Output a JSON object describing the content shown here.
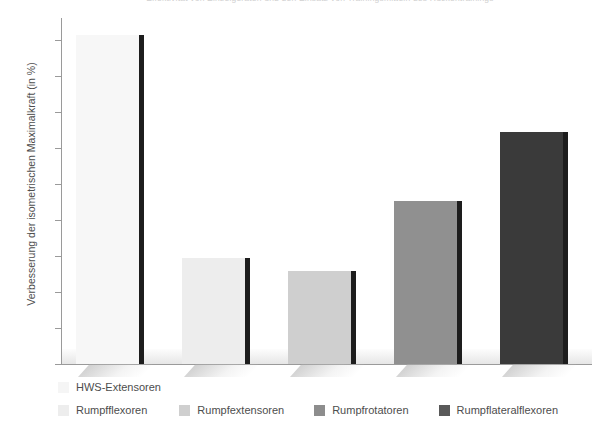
{
  "header": {
    "clipped_text": "Effektivität von Einzelgeräten und den Einsatz von Trainingsmitteln des Rückentrainings"
  },
  "chart_data": {
    "type": "bar",
    "title": "",
    "xlabel": "",
    "ylabel": "Verbesserung der isometrischen Maximalkraft (in %)",
    "ylim": [
      0,
      95
    ],
    "yticks": [
      0,
      10,
      20,
      30,
      40,
      50,
      60,
      70,
      80,
      90
    ],
    "ytick_labels": [
      "0",
      "10",
      "20",
      "30",
      "40",
      "50",
      "60",
      "70",
      "80",
      "90"
    ],
    "grid": false,
    "legend_position": "bottom",
    "categories": [
      "HWS-Extensoren",
      "Rumpfflexoren",
      "Rumpfextensoren",
      "Rumpfrotatoren",
      "Rumpflateralflexoren"
    ],
    "values": [
      91.5,
      29.5,
      25.8,
      45.3,
      64.5
    ],
    "colors": [
      "#f7f7f7",
      "#ededed",
      "#cfcfcf",
      "#909090",
      "#3a3a3a"
    ]
  },
  "legend": {
    "row1": [
      {
        "label": "HWS-Extensoren",
        "color": "#f5f5f5"
      }
    ],
    "row2": [
      {
        "label": "Rumpfflexoren",
        "color": "#ededed"
      },
      {
        "label": "Rumpfextensoren",
        "color": "#cfcfcf"
      },
      {
        "label": "Rumpfrotatoren",
        "color": "#8d8d8d"
      },
      {
        "label": "Rumpflateralflexoren",
        "color": "#595959"
      }
    ]
  },
  "axis": {
    "y_title": "Verbesserung der isometrischen Maximalkraft (in %)"
  }
}
